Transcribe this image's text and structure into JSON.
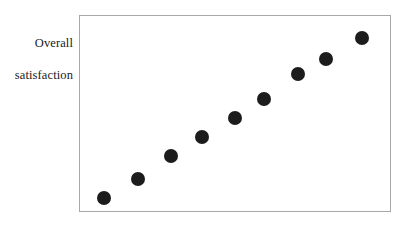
{
  "figure": {
    "name": "scatterplot-figure",
    "background_color": "#ffffff",
    "border_color": "#a8a8a8",
    "point_color": "#1c1c1c"
  },
  "axis_labels": {
    "y_line_1": "Overall",
    "y_line_2": "satisfaction",
    "y_full": "Overall satisfaction",
    "x": ""
  },
  "chart_data": {
    "type": "scatter",
    "title": "",
    "xlabel": "",
    "ylabel": "Overall satisfaction",
    "grid": false,
    "legend": null,
    "axis_ticks": {
      "x": [],
      "y": []
    },
    "xlim": [
      0,
      100
    ],
    "ylim": [
      0,
      100
    ],
    "series": [
      {
        "name": "observations",
        "marker": "filled-circle",
        "color": "#1c1c1c",
        "points": [
          {
            "x": 7.7,
            "y": 6.6
          },
          {
            "x": 18.6,
            "y": 16.2
          },
          {
            "x": 29.5,
            "y": 28.4
          },
          {
            "x": 39.4,
            "y": 38.1
          },
          {
            "x": 50.0,
            "y": 47.7
          },
          {
            "x": 59.3,
            "y": 57.4
          },
          {
            "x": 70.2,
            "y": 70.1
          },
          {
            "x": 79.5,
            "y": 78.2
          },
          {
            "x": 91.0,
            "y": 88.8
          }
        ]
      }
    ]
  }
}
